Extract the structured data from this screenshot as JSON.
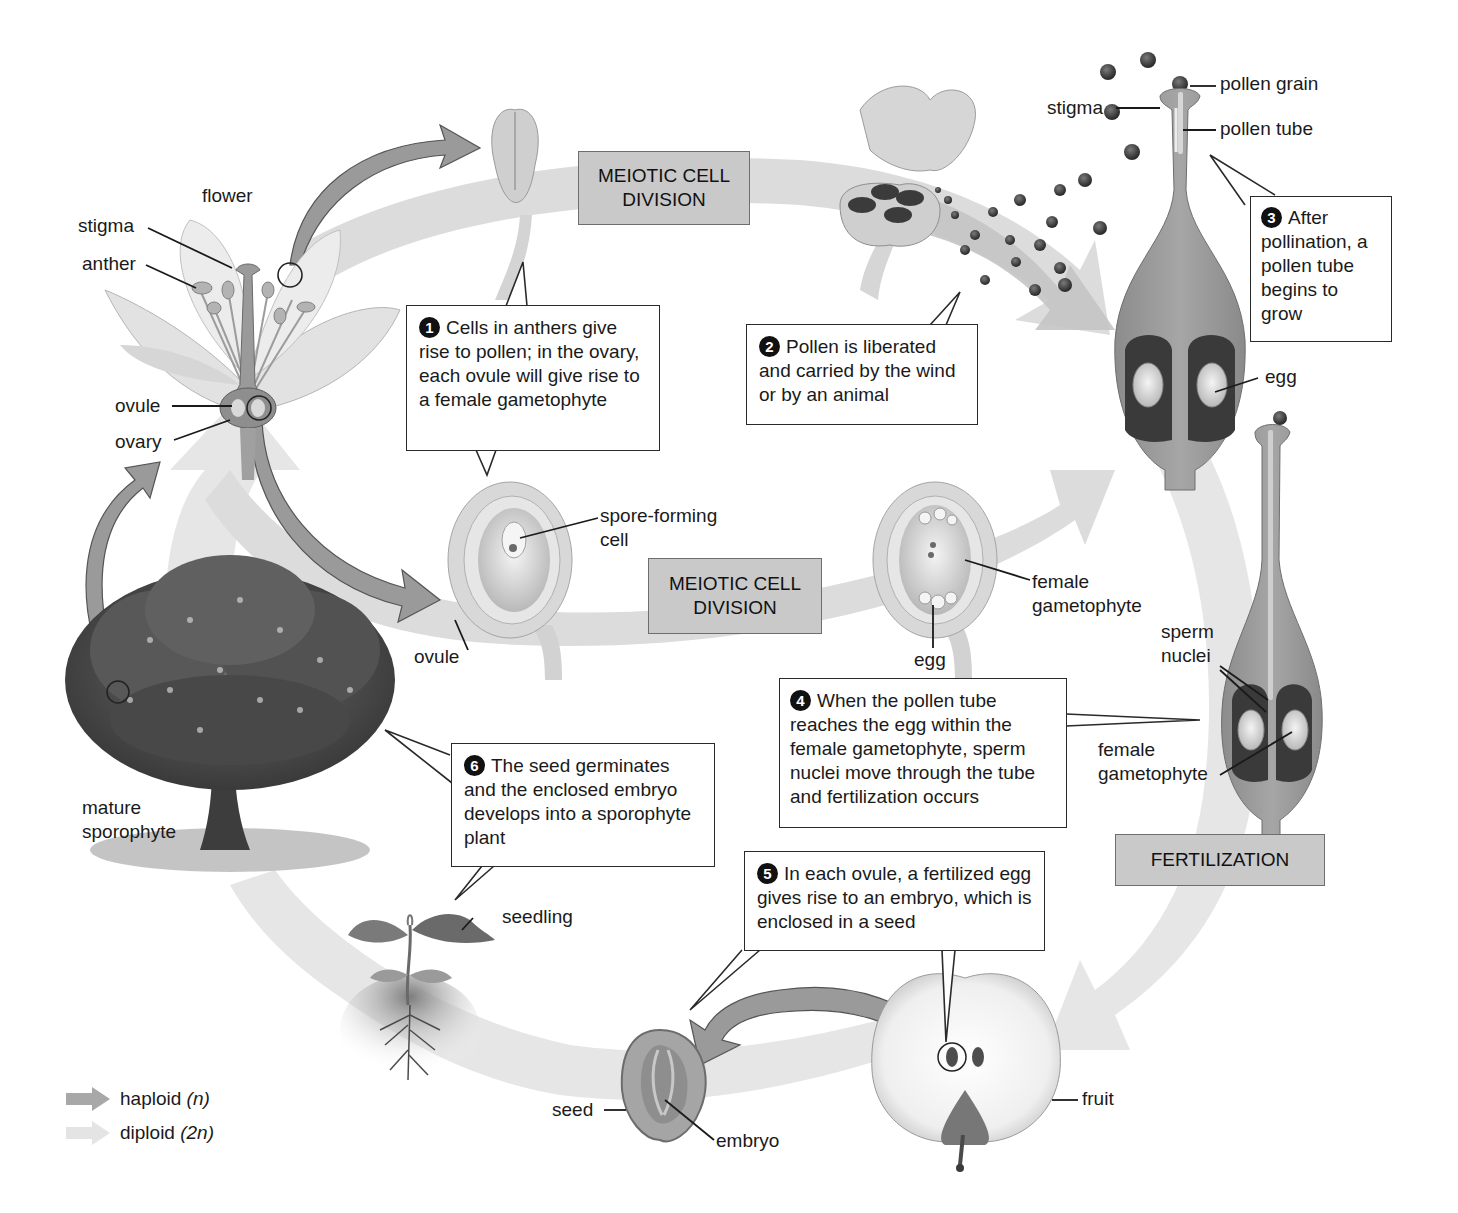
{
  "diagram": {
    "type": "life-cycle"
  },
  "colors": {
    "haploid_arrow": "#a8a8a8",
    "diploid_arrow": "#e4e4e4",
    "stage_box_fill": "#c9c9c9",
    "callout_fill": "#ffffff",
    "text": "#1a1a1a"
  },
  "stages": {
    "meiosis_top": {
      "line1": "MEIOTIC CELL",
      "line2": "DIVISION"
    },
    "meiosis_middle": {
      "line1": "MEIOTIC CELL",
      "line2": "DIVISION"
    },
    "fertilization": {
      "label": "FERTILIZATION"
    }
  },
  "callouts": [
    {
      "number": "1",
      "text": "Cells in anthers give rise to pollen; in the ovary, each ovule will give rise to a female gametophyte"
    },
    {
      "number": "2",
      "text": "Pollen is liberated and carried by the wind or by an animal"
    },
    {
      "number": "3",
      "text": "After pollination, a pollen tube begins to grow"
    },
    {
      "number": "4",
      "text": "When the pollen tube reaches the egg within the female gametophyte, sperm nuclei move through the tube and fertilization occurs"
    },
    {
      "number": "5",
      "text": "In each ovule, a fertilized egg gives rise to an embryo, which is enclosed in a seed"
    },
    {
      "number": "6",
      "text": "The seed germinates and the enclosed embryo develops into a sporophyte plant"
    }
  ],
  "labels": {
    "flower": "flower",
    "flower_stigma": "stigma",
    "anther": "anther",
    "flower_ovule": "ovule",
    "ovary": "ovary",
    "mature_sporophyte": "mature sporophyte",
    "ovule_middle": "ovule",
    "spore_forming_cell": "spore-forming cell",
    "female_gametophyte_middle": "female gametophyte",
    "egg_middle": "egg",
    "pistil_stigma": "stigma",
    "pollen_grain": "pollen grain",
    "pollen_tube": "pollen tube",
    "egg_pistil": "egg",
    "sperm_nuclei": "sperm nuclei",
    "female_gametophyte_pistil": "female gametophyte",
    "seedling": "seedling",
    "seed": "seed",
    "embryo": "embryo",
    "fruit": "fruit"
  },
  "legend": [
    {
      "key": "haploid",
      "label": "haploid",
      "symbol": "(n)",
      "color": "#a8a8a8"
    },
    {
      "key": "diploid",
      "label": "diploid",
      "symbol": "(2n)",
      "color": "#e4e4e4"
    }
  ]
}
